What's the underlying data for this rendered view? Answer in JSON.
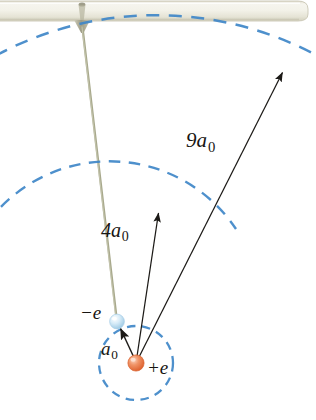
{
  "figure": {
    "background_color": "#ffffff"
  },
  "support_bar": {
    "name": "ceiling-support-bar",
    "fill_color": "#eceadf",
    "edge_color": "#c9c6b4",
    "highlight_color": "#f7f6ef"
  },
  "pivot": {
    "name": "pivot-cone",
    "color": "#b9b6a0"
  },
  "rod": {
    "name": "connecting-rod",
    "color": "#a8a98c"
  },
  "orbits": {
    "dash_color": "#3f87c8",
    "inner": {
      "label": "a",
      "subscript": "0",
      "radius_px": 37
    },
    "middle": {
      "label": "4a",
      "subscript": "0",
      "radius_px": 152
    },
    "outer": {
      "label": "9a",
      "subscript": "0",
      "radius_px": 340
    }
  },
  "particles": {
    "nucleus": {
      "name": "nucleus",
      "charge_label": "+e",
      "color": "#e8703c",
      "highlight": "#f6b79a"
    },
    "electron": {
      "name": "electron",
      "charge_label": "−e",
      "color": "#bcdcef",
      "highlight": "#e9f5fb"
    }
  },
  "arrows": {
    "color": "#1c1a17",
    "a0": {
      "label_main": "a",
      "label_sub": "0"
    },
    "four_a0": {
      "label_main": "4a",
      "label_sub": "0"
    },
    "nine_a0": {
      "label_main": "9a",
      "label_sub": "0"
    }
  },
  "labels": {
    "nine_a0_main": "9a",
    "nine_a0_sub": "0",
    "four_a0_main": "4a",
    "four_a0_sub": "0",
    "a0_main": "a",
    "a0_sub": "0",
    "minus_e": "−e",
    "plus_e": "+e"
  }
}
